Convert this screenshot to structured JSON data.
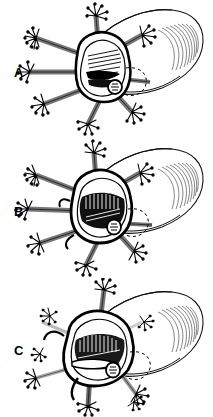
{
  "figure": {
    "name": "three-panel-anatomical-line-drawing",
    "background_color": "#ffffff",
    "ink_color": "#000000",
    "shading_color": "#888888",
    "width": 213,
    "height": 417,
    "panel_count": 3
  },
  "panels": [
    {
      "id": "A",
      "label": "A",
      "label_x": 14,
      "label_y": 72,
      "caption": "",
      "subject": "vertebra-cross-section-with-radiating-needles",
      "needle_count": 8,
      "detached_needle_count": 0,
      "tube": "cylindrical-structure-with-hatched-rounded-end"
    },
    {
      "id": "B",
      "label": "B",
      "label_x": 14,
      "label_y": 211,
      "caption": "",
      "subject": "vertebra-cross-section-with-radiating-needles-darkened-cavity",
      "needle_count": 8,
      "detached_needle_count": 0,
      "tube": "cylindrical-structure-with-hatched-rounded-end"
    },
    {
      "id": "C",
      "label": "C",
      "label_x": 14,
      "label_y": 350,
      "caption": "",
      "subject": "vertebra-cross-section-with-needles-partially-withdrawn",
      "needle_count": 4,
      "detached_needle_count": 4,
      "tube": "cylindrical-structure-with-hatched-rounded-end"
    }
  ]
}
